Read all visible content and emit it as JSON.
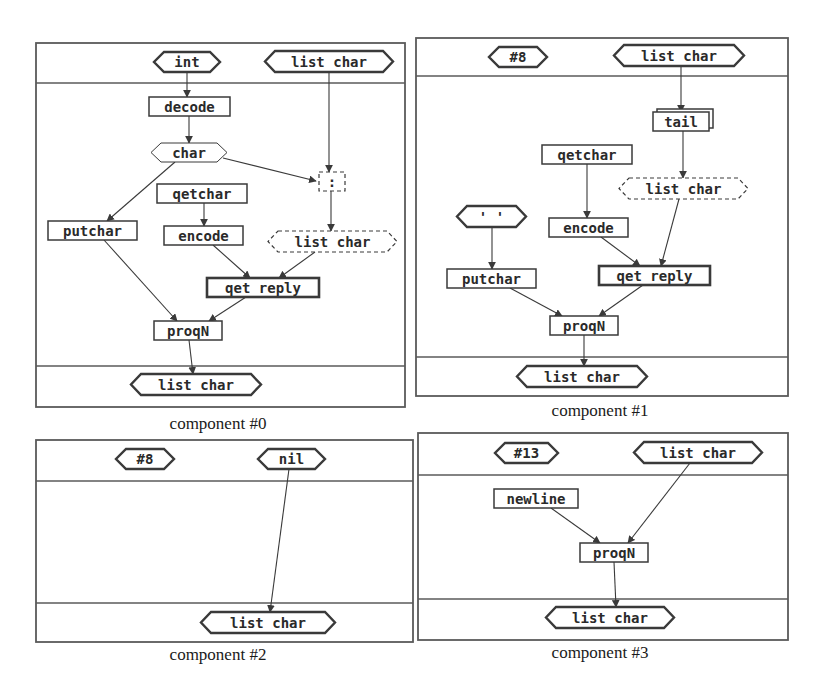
{
  "colors": {
    "ink": "#3a3a3a",
    "frame": "#5a5a5a",
    "background": "#ffffff",
    "caption": "#1a1a1a"
  },
  "components": [
    {
      "id": "component-0",
      "caption": "component #0",
      "caption_pos": [
        218,
        427
      ],
      "frame": {
        "x": 36,
        "y": 43,
        "w": 369,
        "h": 364,
        "header_y": 83,
        "footer_y": 366
      },
      "nodes": [
        {
          "id": "in-int",
          "type": "hex",
          "label": "int",
          "x": 154,
          "y": 52,
          "w": 66,
          "h": 20,
          "style": "solid"
        },
        {
          "id": "in-list",
          "type": "hex",
          "label": "list char",
          "x": 265,
          "y": 51,
          "w": 128,
          "h": 21,
          "style": "solid"
        },
        {
          "id": "decode",
          "type": "box",
          "label": "decode",
          "x": 149,
          "y": 97,
          "w": 81,
          "h": 19,
          "style": "solid"
        },
        {
          "id": "char",
          "type": "hex",
          "label": "char",
          "x": 151,
          "y": 143,
          "w": 76,
          "h": 19,
          "style": "thin"
        },
        {
          "id": "cons",
          "type": "box",
          "label": ":",
          "x": 319,
          "y": 172,
          "w": 26,
          "h": 19,
          "style": "dashed"
        },
        {
          "id": "getchar",
          "type": "box",
          "label": "qetchar",
          "x": 157,
          "y": 184,
          "w": 90,
          "h": 19,
          "style": "solid"
        },
        {
          "id": "putchar",
          "type": "box",
          "label": "putchar",
          "x": 48,
          "y": 221,
          "w": 89,
          "h": 19,
          "style": "solid"
        },
        {
          "id": "encode",
          "type": "box",
          "label": "encode",
          "x": 164,
          "y": 226,
          "w": 79,
          "h": 19,
          "style": "solid"
        },
        {
          "id": "list-mid",
          "type": "hex",
          "label": "list char",
          "x": 268,
          "y": 231,
          "w": 129,
          "h": 21,
          "style": "dashed"
        },
        {
          "id": "get-reply",
          "type": "box",
          "label": "qet reply",
          "x": 207,
          "y": 278,
          "w": 112,
          "h": 19,
          "style": "thick"
        },
        {
          "id": "progn",
          "type": "box",
          "label": "proqN",
          "x": 154,
          "y": 321,
          "w": 68,
          "h": 19,
          "style": "solid"
        },
        {
          "id": "out-list",
          "type": "hex",
          "label": "list char",
          "x": 131,
          "y": 374,
          "w": 130,
          "h": 21,
          "style": "solid"
        }
      ],
      "edges": [
        {
          "from": [
            187,
            72
          ],
          "to": [
            187,
            97
          ]
        },
        {
          "from": [
            189,
            116
          ],
          "to": [
            189,
            143
          ]
        },
        {
          "from": [
            329,
            72
          ],
          "to": [
            329,
            172
          ]
        },
        {
          "from": [
            223,
            158
          ],
          "to": [
            316,
            181
          ]
        },
        {
          "from": [
            175,
            162
          ],
          "to": [
            107,
            221
          ]
        },
        {
          "from": [
            204,
            203
          ],
          "to": [
            204,
            226
          ]
        },
        {
          "from": [
            331,
            191
          ],
          "to": [
            331,
            231
          ]
        },
        {
          "from": [
            213,
            245
          ],
          "to": [
            250,
            278
          ]
        },
        {
          "from": [
            315,
            252
          ],
          "to": [
            279,
            278
          ]
        },
        {
          "from": [
            104,
            240
          ],
          "to": [
            177,
            321
          ]
        },
        {
          "from": [
            246,
            297
          ],
          "to": [
            209,
            321
          ]
        },
        {
          "from": [
            189,
            340
          ],
          "to": [
            193,
            374
          ]
        }
      ]
    },
    {
      "id": "component-1",
      "caption": "component #1",
      "caption_pos": [
        600,
        414
      ],
      "frame": {
        "x": 416,
        "y": 38,
        "w": 372,
        "h": 358,
        "header_y": 76,
        "footer_y": 357
      },
      "nodes": [
        {
          "id": "in-8",
          "type": "hex",
          "label": "#8",
          "x": 489,
          "y": 47,
          "w": 58,
          "h": 20,
          "style": "solid"
        },
        {
          "id": "in-list",
          "type": "hex",
          "label": "list char",
          "x": 614,
          "y": 45,
          "w": 130,
          "h": 21,
          "style": "solid"
        },
        {
          "id": "tail",
          "type": "stack",
          "label": "tail",
          "x": 653,
          "y": 112,
          "w": 56,
          "h": 19,
          "style": "solid"
        },
        {
          "id": "getchar",
          "type": "box",
          "label": "qetchar",
          "x": 542,
          "y": 145,
          "w": 90,
          "h": 19,
          "style": "solid"
        },
        {
          "id": "list-mid",
          "type": "hex",
          "label": "list char",
          "x": 619,
          "y": 178,
          "w": 129,
          "h": 21,
          "style": "dashed"
        },
        {
          "id": "quote-space",
          "type": "hex",
          "label": "' '",
          "x": 457,
          "y": 206,
          "w": 69,
          "h": 21,
          "style": "solid"
        },
        {
          "id": "encode",
          "type": "box",
          "label": "encode",
          "x": 549,
          "y": 218,
          "w": 79,
          "h": 19,
          "style": "solid"
        },
        {
          "id": "putchar",
          "type": "box",
          "label": "putchar",
          "x": 447,
          "y": 269,
          "w": 89,
          "h": 19,
          "style": "solid"
        },
        {
          "id": "get-reply",
          "type": "box",
          "label": "qet reply",
          "x": 599,
          "y": 266,
          "w": 111,
          "h": 19,
          "style": "thick"
        },
        {
          "id": "progn",
          "type": "box",
          "label": "proqN",
          "x": 550,
          "y": 316,
          "w": 68,
          "h": 19,
          "style": "solid"
        },
        {
          "id": "out-list",
          "type": "hex",
          "label": "list char",
          "x": 517,
          "y": 366,
          "w": 130,
          "h": 21,
          "style": "solid"
        }
      ],
      "edges": [
        {
          "from": [
            681,
            66
          ],
          "to": [
            681,
            112
          ]
        },
        {
          "from": [
            683,
            131
          ],
          "to": [
            683,
            178
          ]
        },
        {
          "from": [
            587,
            164
          ],
          "to": [
            587,
            218
          ]
        },
        {
          "from": [
            492,
            227
          ],
          "to": [
            492,
            269
          ]
        },
        {
          "from": [
            601,
            237
          ],
          "to": [
            640,
            266
          ]
        },
        {
          "from": [
            679,
            199
          ],
          "to": [
            661,
            266
          ]
        },
        {
          "from": [
            510,
            288
          ],
          "to": [
            562,
            316
          ]
        },
        {
          "from": [
            643,
            285
          ],
          "to": [
            599,
            316
          ]
        },
        {
          "from": [
            584,
            335
          ],
          "to": [
            584,
            366
          ]
        }
      ]
    },
    {
      "id": "component-2",
      "caption": "component #2",
      "caption_pos": [
        218,
        658
      ],
      "frame": {
        "x": 36,
        "y": 440,
        "w": 377,
        "h": 202,
        "header_y": 481,
        "footer_y": 603
      },
      "nodes": [
        {
          "id": "in-8",
          "type": "hex",
          "label": "#8",
          "x": 116,
          "y": 449,
          "w": 58,
          "h": 20,
          "style": "solid"
        },
        {
          "id": "in-nil",
          "type": "hex",
          "label": "nil",
          "x": 258,
          "y": 449,
          "w": 67,
          "h": 20,
          "style": "solid"
        },
        {
          "id": "out-list",
          "type": "hex",
          "label": "list char",
          "x": 201,
          "y": 612,
          "w": 134,
          "h": 21,
          "style": "solid"
        }
      ],
      "edges": [
        {
          "from": [
            289,
            469
          ],
          "to": [
            270,
            612
          ]
        }
      ]
    },
    {
      "id": "component-3",
      "caption": "component #3",
      "caption_pos": [
        600,
        656
      ],
      "frame": {
        "x": 418,
        "y": 433,
        "w": 370,
        "h": 207,
        "header_y": 475,
        "footer_y": 599
      },
      "nodes": [
        {
          "id": "in-13",
          "type": "hex",
          "label": "#13",
          "x": 495,
          "y": 443,
          "w": 63,
          "h": 20,
          "style": "solid"
        },
        {
          "id": "in-list",
          "type": "hex",
          "label": "list char",
          "x": 634,
          "y": 442,
          "w": 128,
          "h": 21,
          "style": "solid"
        },
        {
          "id": "newline",
          "type": "box",
          "label": "newline",
          "x": 494,
          "y": 489,
          "w": 84,
          "h": 19,
          "style": "solid"
        },
        {
          "id": "progn",
          "type": "box",
          "label": "proqN",
          "x": 580,
          "y": 543,
          "w": 68,
          "h": 19,
          "style": "solid"
        },
        {
          "id": "out-list",
          "type": "hex",
          "label": "list char",
          "x": 546,
          "y": 607,
          "w": 128,
          "h": 21,
          "style": "solid"
        }
      ],
      "edges": [
        {
          "from": [
            551,
            508
          ],
          "to": [
            600,
            543
          ]
        },
        {
          "from": [
            690,
            463
          ],
          "to": [
            628,
            543
          ]
        },
        {
          "from": [
            614,
            562
          ],
          "to": [
            616,
            607
          ]
        }
      ]
    }
  ]
}
